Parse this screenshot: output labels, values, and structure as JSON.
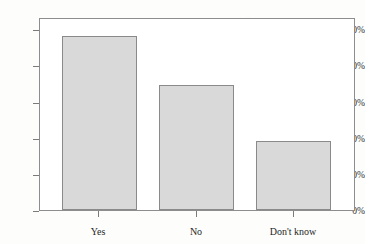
{
  "chart_data": {
    "type": "bar",
    "title": "",
    "xlabel": "",
    "ylabel": "",
    "categories": [
      "Yes",
      "No",
      "Don't know"
    ],
    "values": [
      47.0,
      33.8,
      18.7
    ],
    "value_labels": [
      "47%",
      "33.8%",
      "18.7%"
    ],
    "ylim": [
      0,
      52
    ],
    "yticks": [
      0,
      10,
      20,
      30,
      40,
      50
    ],
    "ytick_labels": [
      "0%",
      "10%",
      "20%",
      "30%",
      "40%",
      "50%"
    ],
    "grid": false,
    "legend": null,
    "bar_fill_color": "#d9d9d9",
    "bar_edge_color": "#8a8a8a",
    "frame_color": "#8d8d8d",
    "text_color": "#2b2b2b",
    "background_color": "#ffffff"
  },
  "axes": {
    "y": {
      "ticks": [
        {
          "value": 50,
          "label": "50%"
        },
        {
          "value": 40,
          "label": "40%"
        },
        {
          "value": 30,
          "label": "30%"
        },
        {
          "value": 20,
          "label": "20%"
        },
        {
          "value": 10,
          "label": "10%"
        },
        {
          "value": 0,
          "label": "0%"
        }
      ]
    },
    "x": {
      "ticks": [
        {
          "label": "Yes"
        },
        {
          "label": "No"
        },
        {
          "label": "Don't know"
        }
      ]
    }
  }
}
